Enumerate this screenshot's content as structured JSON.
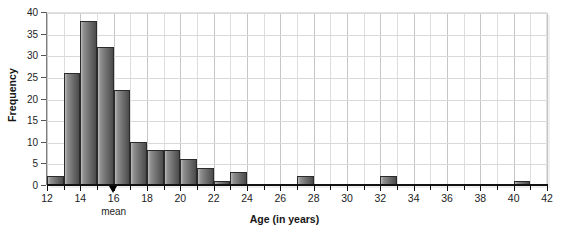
{
  "chart_data": {
    "type": "bar",
    "title": "",
    "xlabel": "Age (in years)",
    "ylabel": "Frequency",
    "xlim": [
      12,
      42
    ],
    "ylim": [
      0,
      40
    ],
    "grid": true,
    "legend": null,
    "bin_width": 1,
    "x_tick_step": 2,
    "x_minor_tick_step": 1,
    "y_tick_step": 5,
    "xticks": [
      12,
      14,
      16,
      18,
      20,
      22,
      24,
      26,
      28,
      30,
      32,
      34,
      36,
      38,
      40,
      42
    ],
    "xtick_labels": [
      "12",
      "14",
      "16",
      "18",
      "20",
      "22",
      "24",
      "26",
      "28",
      "30",
      "32",
      "34",
      "36",
      "38",
      "40",
      "42"
    ],
    "yticks": [
      0,
      5,
      10,
      15,
      20,
      25,
      30,
      35,
      40
    ],
    "ytick_labels": [
      "0",
      "5",
      "10",
      "15",
      "20",
      "25",
      "30",
      "35",
      "40"
    ],
    "bin_edges": [
      12,
      13,
      14,
      15,
      16,
      17,
      18,
      19,
      20,
      21,
      22,
      23,
      24,
      25,
      26,
      27,
      28,
      29,
      30,
      31,
      32,
      33,
      34,
      35,
      36,
      37,
      38,
      39,
      40,
      41,
      42
    ],
    "categories": [
      "12-13",
      "13-14",
      "14-15",
      "15-16",
      "16-17",
      "17-18",
      "18-19",
      "19-20",
      "20-21",
      "21-22",
      "22-23",
      "23-24",
      "24-25",
      "25-26",
      "26-27",
      "27-28",
      "28-29",
      "29-30",
      "30-31",
      "31-32",
      "32-33",
      "33-34",
      "34-35",
      "35-36",
      "36-37",
      "37-38",
      "38-39",
      "39-40",
      "40-41",
      "41-42"
    ],
    "values": [
      2,
      26,
      38,
      32,
      22,
      10,
      8,
      8,
      6,
      4,
      1,
      3,
      0,
      0,
      0,
      2,
      0,
      0,
      0,
      0,
      2,
      0,
      0,
      0,
      0,
      0,
      0,
      0,
      1,
      0
    ],
    "annotations": [
      {
        "label": "mean",
        "x": 16,
        "marker": "triangle-up",
        "color": "#000000"
      }
    ],
    "colors": {
      "bar_fill_light": "#b9b9b9",
      "bar_fill_dark": "#4a4a4a",
      "bar_border": "#2b2b2b",
      "grid": "#dedede",
      "grid_major": "#c6c6c6",
      "axis": "#111111",
      "text": "#1d1d1d",
      "background": "#ffffff"
    }
  }
}
